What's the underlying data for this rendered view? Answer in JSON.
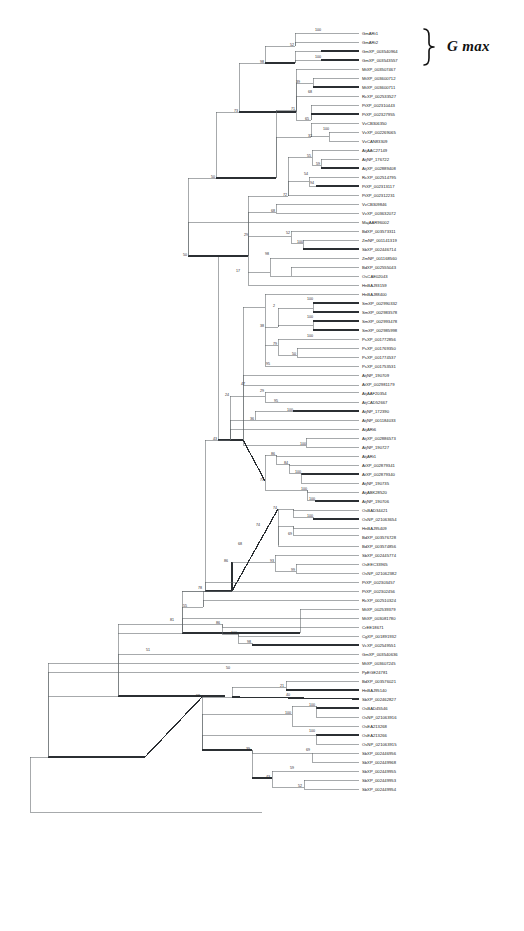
{
  "figure": {
    "type": "phylogenetic-tree",
    "title": "",
    "background_color": "#ffffff",
    "width": 524,
    "height": 931
  },
  "annotations": [
    {
      "id": "g-max-bracket",
      "label": "G max",
      "style": "bold-italic",
      "covers_tips": [
        "GmARt1",
        "GmARt2",
        "GmXP_003540964",
        "GmXP_003543557"
      ]
    }
  ],
  "chart_data": {
    "type": "tree",
    "title": "",
    "xlabel": "",
    "ylabel": "",
    "grid": false,
    "legend": "none",
    "tip_count": 99,
    "support_label_type": "bootstrap",
    "tips": [
      {
        "i": 0,
        "label": "GmARt1",
        "y": 33
      },
      {
        "i": 1,
        "label": "GmARt2",
        "y": 42
      },
      {
        "i": 2,
        "label": "GmXP_003540964",
        "y": 51
      },
      {
        "i": 3,
        "label": "GmXP_003543557",
        "y": 60
      },
      {
        "i": 4,
        "label": "MtXP_003507467",
        "y": 69
      },
      {
        "i": 5,
        "label": "MtXP_003600712",
        "y": 78
      },
      {
        "i": 6,
        "label": "MtXP_003600711",
        "y": 87
      },
      {
        "i": 7,
        "label": "RcXP_002533527",
        "y": 96
      },
      {
        "i": 8,
        "label": "PtXP_002310443",
        "y": 105
      },
      {
        "i": 9,
        "label": "PtXP_002327955",
        "y": 114
      },
      {
        "i": 10,
        "label": "VvCB306350",
        "y": 123
      },
      {
        "i": 11,
        "label": "VvXP_002269065",
        "y": 132
      },
      {
        "i": 12,
        "label": "VvCAN83309",
        "y": 141
      },
      {
        "i": 13,
        "label": "AtjAAC27149",
        "y": 150
      },
      {
        "i": 14,
        "label": "AtjNP_176722",
        "y": 159
      },
      {
        "i": 15,
        "label": "AtjXP_002889408",
        "y": 168
      },
      {
        "i": 16,
        "label": "RcXP_002514795",
        "y": 177
      },
      {
        "i": 17,
        "label": "PtXP_002313117",
        "y": 186
      },
      {
        "i": 18,
        "label": "PtXP_002312231",
        "y": 195
      },
      {
        "i": 19,
        "label": "VvCB309846",
        "y": 204
      },
      {
        "i": 20,
        "label": "VvXP_003632072",
        "y": 213
      },
      {
        "i": 21,
        "label": "MajAAR96002",
        "y": 222
      },
      {
        "i": 22,
        "label": "BdXP_003573311",
        "y": 231
      },
      {
        "i": 23,
        "label": "ZmNP_001141319",
        "y": 240
      },
      {
        "i": 24,
        "label": "SbXP_002446714",
        "y": 249
      },
      {
        "i": 25,
        "label": "ZmNP_001168560",
        "y": 258
      },
      {
        "i": 26,
        "label": "BdXP_002555043",
        "y": 267
      },
      {
        "i": 27,
        "label": "OsCAE02043",
        "y": 276
      },
      {
        "i": 28,
        "label": "HnBAJ93159",
        "y": 285
      },
      {
        "i": 29,
        "label": "HnBAJ88400",
        "y": 294
      },
      {
        "i": 30,
        "label": "SmXP_002990332",
        "y": 303
      },
      {
        "i": 31,
        "label": "SmXP_002983578",
        "y": 312
      },
      {
        "i": 32,
        "label": "SmXP_002993478",
        "y": 321
      },
      {
        "i": 33,
        "label": "SmXP_002985998",
        "y": 330
      },
      {
        "i": 34,
        "label": "PsXP_001772856",
        "y": 339
      },
      {
        "i": 35,
        "label": "PsXP_001769350",
        "y": 348
      },
      {
        "i": 36,
        "label": "PsXP_001774537",
        "y": 357
      },
      {
        "i": 37,
        "label": "PsXP_001753531",
        "y": 366
      },
      {
        "i": 38,
        "label": "AtjNP_190709",
        "y": 375
      },
      {
        "i": 39,
        "label": "AtXP_002981179",
        "y": 384
      },
      {
        "i": 40,
        "label": "AtjAAF20354",
        "y": 393
      },
      {
        "i": 41,
        "label": "AtjCAD52667",
        "y": 402
      },
      {
        "i": 42,
        "label": "AtjNP_172390",
        "y": 411
      },
      {
        "i": 43,
        "label": "AtjNP_001184033",
        "y": 420
      },
      {
        "i": 44,
        "label": "AtjARt6",
        "y": 429
      },
      {
        "i": 45,
        "label": "AtjXP_002886573",
        "y": 438
      },
      {
        "i": 46,
        "label": "AtjNP_190727",
        "y": 447
      },
      {
        "i": 47,
        "label": "AtjARt1",
        "y": 456
      },
      {
        "i": 48,
        "label": "AtXP_002879341",
        "y": 465
      },
      {
        "i": 49,
        "label": "AtXP_002879340",
        "y": 474
      },
      {
        "i": 50,
        "label": "AtjNP_190735",
        "y": 483
      },
      {
        "i": 51,
        "label": "AtjABK28520",
        "y": 492
      },
      {
        "i": 52,
        "label": "AtjNP_190706",
        "y": 501
      },
      {
        "i": 53,
        "label": "OsBAD34421",
        "y": 510
      },
      {
        "i": 54,
        "label": "OsNP_021063654",
        "y": 519
      },
      {
        "i": 55,
        "label": "HnBAJ95409",
        "y": 528
      },
      {
        "i": 56,
        "label": "BdXP_003576728",
        "y": 537
      },
      {
        "i": 57,
        "label": "BdXP_003574856",
        "y": 546
      },
      {
        "i": 58,
        "label": "SbXP_002445774",
        "y": 555
      },
      {
        "i": 59,
        "label": "OsEEC33965",
        "y": 564
      },
      {
        "i": 60,
        "label": "OsNP_021062382",
        "y": 573
      },
      {
        "i": 61,
        "label": "PtXP_002303457",
        "y": 582
      },
      {
        "i": 62,
        "label": "PtXP_002302456",
        "y": 591
      },
      {
        "i": 63,
        "label": "RcXP_002510324",
        "y": 600
      },
      {
        "i": 64,
        "label": "MtXP_002539379",
        "y": 609
      },
      {
        "i": 65,
        "label": "MtXP_003081780",
        "y": 618
      },
      {
        "i": 66,
        "label": "CrEE18671",
        "y": 627
      },
      {
        "i": 67,
        "label": "CgXP_001891932",
        "y": 636
      },
      {
        "i": 68,
        "label": "VcXP_002549551",
        "y": 645
      },
      {
        "i": 69,
        "label": "GmXP_003540636",
        "y": 654
      },
      {
        "i": 70,
        "label": "MtXP_003607245",
        "y": 663
      },
      {
        "i": 71,
        "label": "PpEGE24781",
        "y": 672
      },
      {
        "i": 72,
        "label": "BdXP_003576021",
        "y": 681
      },
      {
        "i": 73,
        "label": "HnBAJ95140",
        "y": 690
      },
      {
        "i": 74,
        "label": "SbXP_002462827",
        "y": 699
      },
      {
        "i": 75,
        "label": "OsBAD45546",
        "y": 708
      },
      {
        "i": 76,
        "label": "OsNP_021063916",
        "y": 717
      },
      {
        "i": 77,
        "label": "OsEA213268",
        "y": 726
      },
      {
        "i": 78,
        "label": "OsEA213266",
        "y": 735
      },
      {
        "i": 79,
        "label": "OsNP_021063915",
        "y": 744
      },
      {
        "i": 80,
        "label": "SbXP_002446956",
        "y": 753
      },
      {
        "i": 81,
        "label": "SbXP_002449968",
        "y": 762
      },
      {
        "i": 82,
        "label": "SbXP_002449955",
        "y": 771
      },
      {
        "i": 83,
        "label": "SbXP_002449953",
        "y": 780
      },
      {
        "i": 84,
        "label": "SbXP_002449954",
        "y": 789
      }
    ],
    "support_values": [
      {
        "v": "100",
        "x": 318,
        "y": 31
      },
      {
        "v": "52",
        "x": 292,
        "y": 46
      },
      {
        "v": "98",
        "x": 262,
        "y": 63
      },
      {
        "v": "100",
        "x": 318,
        "y": 58
      },
      {
        "v": "73",
        "x": 236,
        "y": 112
      },
      {
        "v": "39",
        "x": 298,
        "y": 83
      },
      {
        "v": "68",
        "x": 310,
        "y": 93
      },
      {
        "v": "71",
        "x": 293,
        "y": 110
      },
      {
        "v": "65",
        "x": 307,
        "y": 120
      },
      {
        "v": "32",
        "x": 310,
        "y": 137
      },
      {
        "v": "100",
        "x": 326,
        "y": 130
      },
      {
        "v": "50",
        "x": 213,
        "y": 178
      },
      {
        "v": "55",
        "x": 309,
        "y": 157
      },
      {
        "v": "59",
        "x": 318,
        "y": 165
      },
      {
        "v": "54",
        "x": 306,
        "y": 175
      },
      {
        "v": "94",
        "x": 312,
        "y": 184
      },
      {
        "v": "72",
        "x": 285,
        "y": 196
      },
      {
        "v": "68",
        "x": 273,
        "y": 212
      },
      {
        "v": "50",
        "x": 185,
        "y": 256
      },
      {
        "v": "29",
        "x": 246,
        "y": 236
      },
      {
        "v": "52",
        "x": 288,
        "y": 234
      },
      {
        "v": "100",
        "x": 300,
        "y": 243
      },
      {
        "v": "98",
        "x": 267,
        "y": 255
      },
      {
        "v": "17",
        "x": 238,
        "y": 272
      },
      {
        "v": "100",
        "x": 310,
        "y": 300
      },
      {
        "v": "2",
        "x": 274,
        "y": 307
      },
      {
        "v": "100",
        "x": 310,
        "y": 318
      },
      {
        "v": "38",
        "x": 262,
        "y": 327
      },
      {
        "v": "100",
        "x": 310,
        "y": 337
      },
      {
        "v": "79",
        "x": 275,
        "y": 345
      },
      {
        "v": "50",
        "x": 294,
        "y": 355
      },
      {
        "v": "95",
        "x": 268,
        "y": 365
      },
      {
        "v": "47",
        "x": 243,
        "y": 385
      },
      {
        "v": "24",
        "x": 227,
        "y": 396
      },
      {
        "v": "29",
        "x": 262,
        "y": 392
      },
      {
        "v": "95",
        "x": 276,
        "y": 402
      },
      {
        "v": "100",
        "x": 290,
        "y": 411
      },
      {
        "v": "36",
        "x": 252,
        "y": 420
      },
      {
        "v": "43",
        "x": 215,
        "y": 440
      },
      {
        "v": "100",
        "x": 303,
        "y": 445
      },
      {
        "v": "86",
        "x": 273,
        "y": 455
      },
      {
        "v": "84",
        "x": 286,
        "y": 464
      },
      {
        "v": "100",
        "x": 298,
        "y": 473
      },
      {
        "v": "71",
        "x": 262,
        "y": 481
      },
      {
        "v": "100",
        "x": 304,
        "y": 490
      },
      {
        "v": "100",
        "x": 312,
        "y": 500
      },
      {
        "v": "74",
        "x": 275,
        "y": 509
      },
      {
        "v": "100",
        "x": 310,
        "y": 517
      },
      {
        "v": "74",
        "x": 258,
        "y": 526
      },
      {
        "v": "69",
        "x": 290,
        "y": 535
      },
      {
        "v": "68",
        "x": 240,
        "y": 545
      },
      {
        "v": "86",
        "x": 226,
        "y": 562
      },
      {
        "v": "93",
        "x": 272,
        "y": 562
      },
      {
        "v": "99",
        "x": 293,
        "y": 571
      },
      {
        "v": "78",
        "x": 200,
        "y": 589
      },
      {
        "v": "55",
        "x": 185,
        "y": 607
      },
      {
        "v": "81",
        "x": 172,
        "y": 621
      },
      {
        "v": "86",
        "x": 218,
        "y": 624
      },
      {
        "v": "100",
        "x": 234,
        "y": 634
      },
      {
        "v": "51",
        "x": 148,
        "y": 651
      },
      {
        "v": "98",
        "x": 249,
        "y": 643
      },
      {
        "v": "50",
        "x": 228,
        "y": 669
      },
      {
        "v": "21",
        "x": 282,
        "y": 687
      },
      {
        "v": "98",
        "x": 198,
        "y": 697
      },
      {
        "v": "40",
        "x": 288,
        "y": 696
      },
      {
        "v": "100",
        "x": 312,
        "y": 706
      },
      {
        "v": "100",
        "x": 288,
        "y": 714
      },
      {
        "v": "100",
        "x": 312,
        "y": 732
      },
      {
        "v": "39",
        "x": 248,
        "y": 750
      },
      {
        "v": "69",
        "x": 308,
        "y": 751
      },
      {
        "v": "59",
        "x": 292,
        "y": 769
      },
      {
        "v": "43",
        "x": 268,
        "y": 778
      },
      {
        "v": "52",
        "x": 300,
        "y": 787
      }
    ]
  }
}
